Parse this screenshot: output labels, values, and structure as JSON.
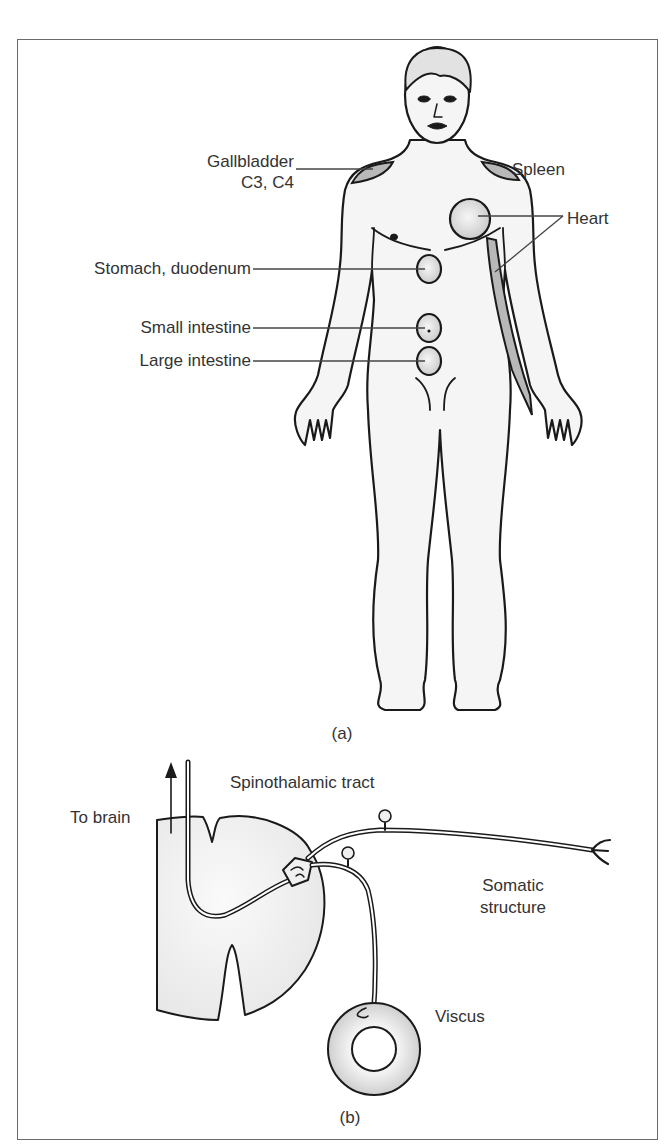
{
  "figure": {
    "panel_a": {
      "caption": "(a)",
      "labels": {
        "gallbladder": "Gallbladder",
        "gallbladder_segments": "C3, C4",
        "spleen": "Spleen",
        "heart": "Heart",
        "stomach": "Stomach, duodenum",
        "small_intestine": "Small intestine",
        "large_intestine": "Large intestine"
      }
    },
    "panel_b": {
      "caption": "(b)",
      "labels": {
        "to_brain": "To brain",
        "tract": "Spinothalamic tract",
        "somatic_1": "Somatic",
        "somatic_2": "structure",
        "viscus": "Viscus"
      }
    },
    "colors": {
      "outline": "#1a1a1a",
      "skin": "#f4f4f4",
      "referred_area": "#b8b8b8",
      "organ_fill": "#dcdcdc",
      "label_text": "#333333",
      "frame": "#6a6a6a"
    }
  }
}
